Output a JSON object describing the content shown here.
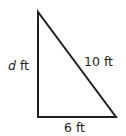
{
  "diagram": {
    "type": "right-triangle",
    "colors": {
      "stroke": "#231f20",
      "text": "#231f20",
      "background": "#ffffff"
    },
    "vertices": {
      "top": [
        38,
        12
      ],
      "bottom_left": [
        38,
        117
      ],
      "bottom_right": [
        116,
        117
      ]
    },
    "labels": {
      "vertical_side_var": "d",
      "vertical_side_unit": " ft",
      "hypotenuse": "10 ft",
      "base": "6 ft"
    }
  }
}
